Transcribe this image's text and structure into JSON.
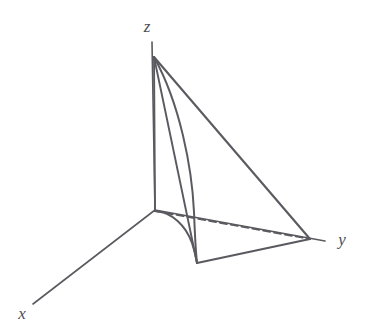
{
  "figure": {
    "type": "math-diagram-3d",
    "background_color": "#ffffff",
    "line_color": "#5a5a60",
    "label_color": "#4e4e52",
    "canvas": {
      "width": 372,
      "height": 333
    }
  },
  "axes": [
    {
      "id": "x",
      "label": "x",
      "label_position": {
        "x": 22,
        "y": 319
      },
      "from": {
        "x": 155,
        "y": 210
      },
      "to": {
        "x": 33,
        "y": 304
      },
      "style": "solid",
      "stroke_width": 1.6
    },
    {
      "id": "y",
      "label": "y",
      "label_position": {
        "x": 342,
        "y": 245
      },
      "from": {
        "x": 155,
        "y": 210
      },
      "to": {
        "x": 325,
        "y": 241
      },
      "style": "solid",
      "stroke_width": 1.6
    },
    {
      "id": "z",
      "label": "z",
      "label_position": {
        "x": 147,
        "y": 32
      },
      "from": {
        "x": 155,
        "y": 210
      },
      "to": {
        "x": 152,
        "y": 42
      },
      "style": "solid",
      "stroke_width": 1.6
    }
  ],
  "vertices": {
    "origin": {
      "x": 155,
      "y": 210
    },
    "apex_z": {
      "x": 154,
      "y": 57
    },
    "y_corner": {
      "x": 310,
      "y": 239
    },
    "front_bottom": {
      "x": 197,
      "y": 263
    }
  },
  "edges": [
    {
      "name": "apex-to-y-upper",
      "style": "solid",
      "from": {
        "x": 154,
        "y": 57
      },
      "to": {
        "x": 310,
        "y": 239
      },
      "stroke_width": 2.1
    },
    {
      "name": "apex-to-front-bottom-inner",
      "style": "solid",
      "from": {
        "x": 154,
        "y": 57
      },
      "to": {
        "x": 197,
        "y": 263
      },
      "stroke_width": 1.9
    },
    {
      "name": "front-bottom-to-y-corner",
      "style": "solid",
      "from": {
        "x": 197,
        "y": 263
      },
      "to": {
        "x": 310,
        "y": 239
      },
      "stroke_width": 2.1
    },
    {
      "name": "origin-to-y-corner-hidden",
      "style": "dashed",
      "from": {
        "x": 155,
        "y": 211
      },
      "to": {
        "x": 310,
        "y": 239
      },
      "stroke_width": 1.9,
      "dash_pattern": "7 4"
    },
    {
      "name": "z-axis-segment-apex-to-origin",
      "style": "solid",
      "from": {
        "x": 154,
        "y": 57
      },
      "to": {
        "x": 155,
        "y": 210
      },
      "stroke_width": 1.9
    }
  ],
  "curves": [
    {
      "name": "vertical-parabolic-edge",
      "description": "curved lateral edge from z apex bowing right down to the front bottom vertex",
      "style": "solid",
      "stroke_width": 2.0,
      "path": "M 154 57 C 180 104, 192 168, 194 212 C 195 238, 196 254, 197 263"
    },
    {
      "name": "ground-parabolic-edge",
      "description": "curved base edge in the xy-plane from origin sweeping right to the front bottom vertex",
      "style": "solid",
      "stroke_width": 2.0,
      "path": "M 155 211 C 172 212, 186 226, 192 243 C 195 252, 196 258, 197 263"
    }
  ],
  "labels": {
    "x": "x",
    "y": "y",
    "z": "z"
  }
}
